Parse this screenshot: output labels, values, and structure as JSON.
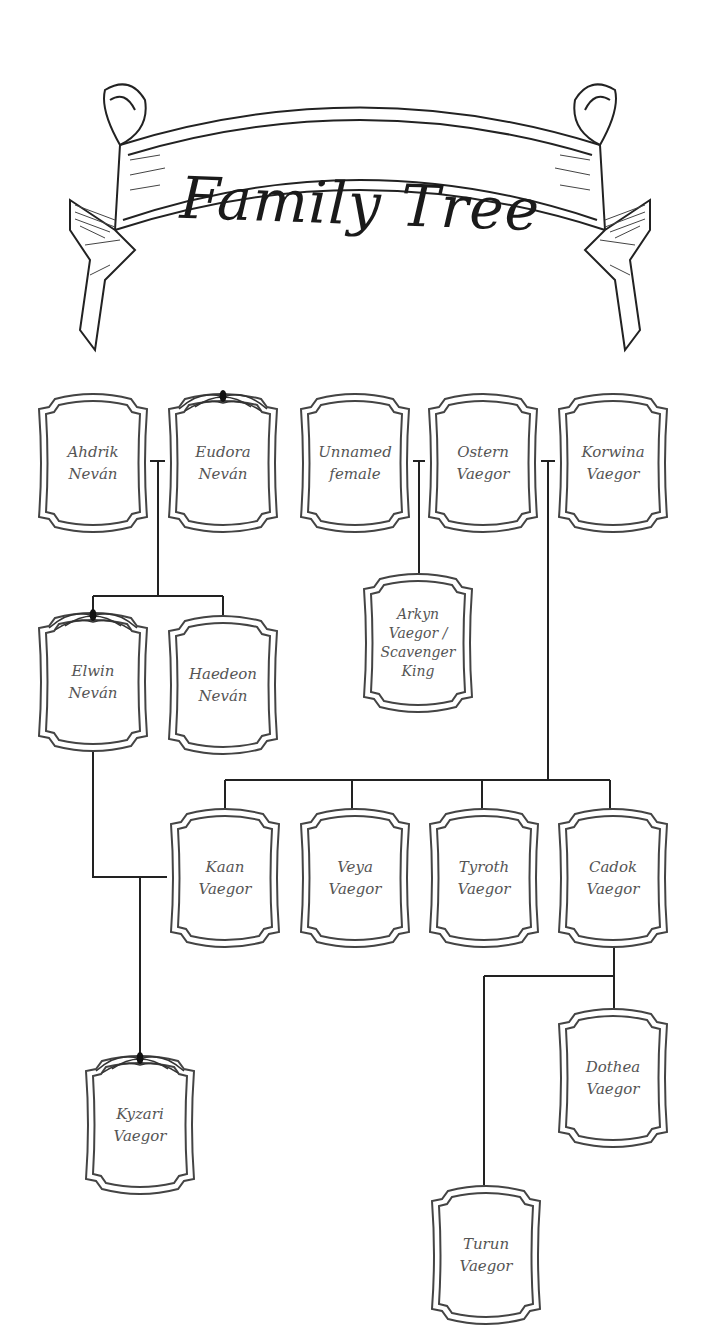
{
  "title": "Family Tree",
  "colors": {
    "line": "#222222",
    "frame": "#444444",
    "text": "#555555",
    "background": "#ffffff"
  },
  "people": {
    "ahdrik": {
      "name": "Ahdrik\nNeván",
      "crown": false
    },
    "eudora": {
      "name": "Eudora\nNeván",
      "crown": true
    },
    "unnamed": {
      "name": "Unnamed\nfemale",
      "crown": false
    },
    "ostern": {
      "name": "Ostern\nVaegor",
      "crown": false
    },
    "korwina": {
      "name": "Korwina\nVaegor",
      "crown": false
    },
    "elwin": {
      "name": "Elwin\nNeván",
      "crown": true
    },
    "haedeon": {
      "name": "Haedeon\nNeván",
      "crown": false
    },
    "arkyn": {
      "name": "Arkyn\nVaegor /\nScavenger\nKing",
      "crown": false
    },
    "kaan": {
      "name": "Kaan\nVaegor",
      "crown": false
    },
    "veya": {
      "name": "Veya\nVaegor",
      "crown": false
    },
    "tyroth": {
      "name": "Tyroth\nVaegor",
      "crown": false
    },
    "cadok": {
      "name": "Cadok\nVaegor",
      "crown": false
    },
    "kyzari": {
      "name": "Kyzari\nVaegor",
      "crown": true
    },
    "dothea": {
      "name": "Dothea\nVaegor",
      "crown": false
    },
    "turun": {
      "name": "Turun\nVaegor",
      "crown": false
    }
  },
  "relationships": [
    {
      "type": "couple",
      "partners": [
        "Ahdrik Neván",
        "Eudora Neván"
      ],
      "children": [
        "Elwin Neván",
        "Haedeon Neván"
      ]
    },
    {
      "type": "couple",
      "partners": [
        "Unnamed female",
        "Ostern Vaegor"
      ],
      "children": [
        "Arkyn Vaegor / Scavenger King"
      ]
    },
    {
      "type": "couple",
      "partners": [
        "Ostern Vaegor",
        "Korwina Vaegor"
      ],
      "children": [
        "Kaan Vaegor",
        "Veya Vaegor",
        "Tyroth Vaegor",
        "Cadok Vaegor"
      ]
    },
    {
      "type": "couple",
      "partners": [
        "Elwin Neván",
        "Kaan Vaegor"
      ],
      "children": [
        "Kyzari Vaegor"
      ]
    },
    {
      "type": "parent",
      "parent": "Cadok Vaegor",
      "children": [
        "Dothea Vaegor",
        "Turun Vaegor"
      ]
    }
  ]
}
